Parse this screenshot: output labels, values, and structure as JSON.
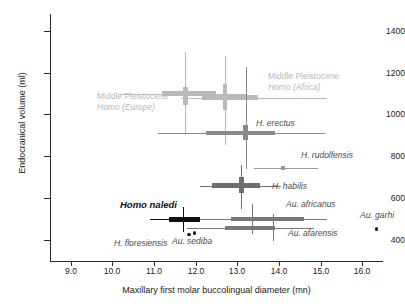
{
  "chart_data": {
    "type": "scatter",
    "title": "",
    "xlabel": "Maxillary first molar buccolingual diameter (mn)",
    "ylabel": "Endocranical volume (ml)",
    "xlim": [
      8.5,
      16.5
    ],
    "ylim": [
      300,
      1480
    ],
    "xticks": [
      "9.0",
      "10.0",
      "11.0",
      "12.0",
      "13.0",
      "14.0",
      "15.0",
      "16.0"
    ],
    "xtick_values": [
      9.0,
      10.0,
      11.0,
      12.0,
      13.0,
      14.0,
      15.0,
      16.0
    ],
    "yticks": [
      "1400",
      "1200",
      "1000",
      "800",
      "600",
      "400"
    ],
    "ytick_values": [
      1400,
      1200,
      1000,
      800,
      600,
      400
    ],
    "grid": false,
    "legend": "none",
    "series": [
      {
        "name": "Middle Pleistocene Homo (Europe)",
        "label": "Middle Pleistocene",
        "label2": "Homo (Europe)",
        "color": "#b9b9b9",
        "x": 11.75,
        "y": 1100,
        "x_box": [
          11.2,
          12.5
        ],
        "x_whisker": [
          10.15,
          13.2
        ],
        "y_box": [
          1045,
          1130
        ],
        "y_whisker": [
          900,
          1300
        ],
        "label_x": 97,
        "label_y": 91
      },
      {
        "name": "Middle Pleistocene Homo (Africa)",
        "label": "Middle Pleistocene",
        "label2": "Homo (Africa)",
        "color": "#b9b9b9",
        "x": 12.7,
        "y": 1080,
        "x_box": [
          12.15,
          13.5
        ],
        "x_whisker": [
          11.65,
          15.15
        ],
        "y_box": [
          1020,
          1145
        ],
        "y_whisker": [
          855,
          1280
        ],
        "label_x": 268,
        "label_y": 71
      },
      {
        "name": "H. erectus",
        "label": "H. erectus",
        "color": "#8a8a8a",
        "x": 13.2,
        "y": 912,
        "x_box": [
          12.25,
          13.9
        ],
        "x_whisker": [
          11.1,
          15.1
        ],
        "y_box": [
          880,
          950
        ],
        "y_whisker": [
          740,
          1225
        ],
        "label_x": 256,
        "label_y": 118
      },
      {
        "name": "H. rudolfensis",
        "label": "H. rudolfensis",
        "color": "#9a9a9a",
        "x": 14.1,
        "y": 745,
        "x_box": [
          14.05,
          14.15
        ],
        "x_whisker": [
          13.4,
          14.95
        ],
        "y_box": [
          742,
          748
        ],
        "y_whisker": [
          735,
          755
        ],
        "label_x": 301,
        "label_y": 150
      },
      {
        "name": "H. habilis",
        "label": "H. habilis",
        "color": "#6e6e6e",
        "x": 13.1,
        "y": 660,
        "x_box": [
          12.4,
          13.55
        ],
        "x_whisker": [
          12.1,
          14.05
        ],
        "y_box": [
          625,
          700
        ],
        "y_whisker": [
          550,
          760
        ],
        "label_x": 272,
        "label_y": 181
      },
      {
        "name": "Homo naledi",
        "label": "Homo naledi",
        "color": "#111111",
        "x": 11.7,
        "y": 500,
        "x_box": [
          11.35,
          12.1
        ],
        "x_whisker": [
          10.9,
          12.45
        ],
        "y_box": [
          492,
          508
        ],
        "y_whisker": [
          437,
          560
        ],
        "label_x": 120,
        "label_y": 200
      },
      {
        "name": "Au. africanus",
        "label": "Au. africanus",
        "color": "#787878",
        "x": 13.35,
        "y": 500,
        "x_box": [
          12.85,
          14.6
        ],
        "x_whisker": [
          12.1,
          15.15
        ],
        "y_box": [
          492,
          508
        ],
        "y_whisker": [
          430,
          572
        ],
        "label_x": 286,
        "label_y": 199
      },
      {
        "name": "Au. afarensis",
        "label": "Au. afarensis",
        "color": "#787878",
        "x": 13.85,
        "y": 458,
        "x_box": [
          12.7,
          13.85
        ],
        "x_whisker": [
          11.8,
          14.85
        ],
        "y_box": [
          450,
          466
        ],
        "y_whisker": [
          395,
          525
        ],
        "label_x": 288,
        "label_y": 228
      },
      {
        "name": "H. floresiensis",
        "label": "H. floresiensis",
        "color": "#1a1a1a",
        "x": 11.85,
        "y": 426,
        "point": true,
        "label_x": 114,
        "label_y": 238
      },
      {
        "name": "Au. sediba",
        "label": "Au. sediba",
        "color": "#1a1a1a",
        "x": 11.98,
        "y": 432,
        "point": true,
        "label_x": 172,
        "label_y": 236
      },
      {
        "name": "Au. garhi",
        "label": "Au. garhi",
        "color": "#1a1a1a",
        "x": 16.35,
        "y": 452,
        "point": true,
        "label_x": 360,
        "label_y": 210
      }
    ]
  }
}
